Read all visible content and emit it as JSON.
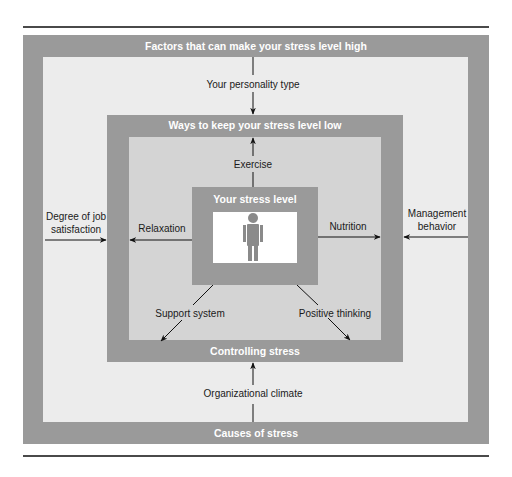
{
  "diagram": {
    "outer_box": {
      "top_title": "Factors that can make your stress level high",
      "bottom_title": "Causes of stress"
    },
    "middle_box": {
      "top_title": "Ways to keep your stress level low",
      "bottom_title": "Controlling stress"
    },
    "center_box": {
      "title": "Your stress level",
      "icon": "person-icon"
    },
    "stress_factors": [
      {
        "label": "Your personality type",
        "position": "top"
      },
      {
        "label": "Degree of job satisfaction",
        "position": "left"
      },
      {
        "label": "Management behavior",
        "position": "right"
      },
      {
        "label": "Organizational climate",
        "position": "bottom"
      }
    ],
    "stress_controls": [
      {
        "label": "Exercise",
        "position": "top"
      },
      {
        "label": "Relaxation",
        "position": "left"
      },
      {
        "label": "Nutrition",
        "position": "right"
      },
      {
        "label": "Support system",
        "position": "bottom-left"
      },
      {
        "label": "Positive thinking",
        "position": "bottom-right"
      }
    ],
    "colors": {
      "band_gray": "#9a9a9a",
      "outer_fill": "#ececec",
      "middle_fill": "#d4d4d4",
      "center_fill": "#ffffff",
      "icon_gray": "#8a8a8a",
      "rule": "#4a4a4a"
    }
  }
}
